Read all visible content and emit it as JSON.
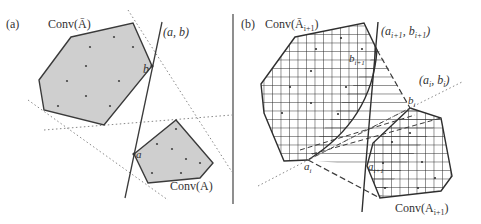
{
  "figure": {
    "panel_a": {
      "tag": "(a)",
      "labels": {
        "conv_upper": "Conv(Ā)",
        "conv_lower": "Conv(A)",
        "line": "(a, b)",
        "point_b": "b",
        "point_a": "a"
      }
    },
    "panel_b": {
      "tag": "(b)",
      "labels": {
        "conv_upper": "Conv(Ā",
        "conv_upper_sub": "i+1",
        "conv_upper_close": ")",
        "conv_lower": "Conv(A",
        "conv_lower_sub": "i+1",
        "conv_lower_close": ")",
        "line_next": "(a",
        "line_next_sub1": "i+1",
        "line_next_mid": ", b",
        "line_next_sub2": "i+1",
        "line_next_close": ")",
        "line_cur": "(a",
        "line_cur_sub1": "i",
        "line_cur_mid": ", b",
        "line_cur_sub2": "i",
        "line_cur_close": ")",
        "point_bi": "b",
        "point_bi_sub": "i",
        "point_ai": "a",
        "point_ai_sub": "i",
        "point_b_next": "b",
        "point_b_next_sub": "i+1",
        "point_a_next": "a",
        "point_a_next_sub": "i+1"
      }
    },
    "colors": {
      "polygon_fill": "#cfcfcf",
      "stroke": "#3a3a3a",
      "dotted": "#888888",
      "hatch": "#2a2a2a"
    }
  }
}
